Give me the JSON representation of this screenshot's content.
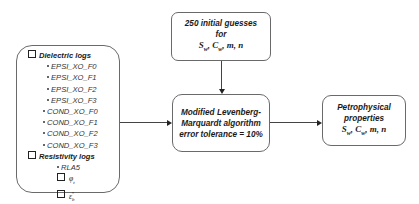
{
  "left_box": {
    "dielectric_heading": "Dielectric logs",
    "dielectric_items": [
      "EPSI_XO_F0",
      "EPSI_XO_F1",
      "EPSI_XO_F2",
      "EPSI_XO_F3",
      "COND_XO_F0",
      "COND_XO_F1",
      "COND_XO_F2",
      "COND_XO_F3"
    ],
    "resistivity_heading": "Resistivity logs",
    "resistivity_items": [
      "RLA5"
    ],
    "symbol_1": "φ",
    "symbol_1_sub": "t",
    "symbol_2": "ε",
    "symbol_2_sub": "b",
    "symbol_2_sup": "*"
  },
  "top_box": {
    "line1": "250 initial guesses",
    "line2": "for",
    "params": "S_w, C_w, m, n"
  },
  "mid_box": {
    "line1": "Modified Levenberg-",
    "line2": "Marquardt algorithm",
    "line3": "error tolerance = 10%"
  },
  "right_box": {
    "line1": "Petrophysical",
    "line2": "properties",
    "params": "S_w, C_w, m, n"
  }
}
